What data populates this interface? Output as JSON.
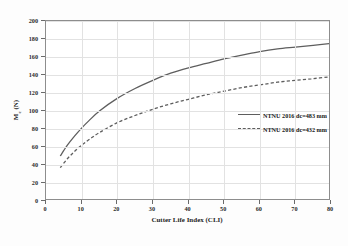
{
  "chart_data": {
    "type": "line",
    "title": "",
    "xlabel": "Cutter Life Index (CLI)",
    "ylabel": "Mₑ (N)",
    "ylabel_main": "M",
    "ylabel_sub": "c",
    "ylabel_unit": " (N)",
    "xlim": [
      0,
      80
    ],
    "ylim": [
      0,
      200
    ],
    "xticks": [
      0,
      10,
      20,
      30,
      40,
      50,
      60,
      70,
      80
    ],
    "yticks": [
      0,
      20,
      40,
      60,
      80,
      100,
      120,
      140,
      160,
      180,
      200
    ],
    "grid": true,
    "legend_position": "right-middle",
    "line_color": "#5e5e5e",
    "grid_color": "#e2e2e2",
    "frame_color": "#8d8d8d",
    "series": [
      {
        "name": "NTNU 2016 dc=483 mm",
        "style": "solid",
        "x": [
          4,
          6,
          8,
          10,
          12,
          15,
          20,
          25,
          30,
          35,
          40,
          45,
          50,
          55,
          60,
          65,
          70,
          75,
          80
        ],
        "values": [
          50,
          62,
          72,
          81,
          89,
          100,
          114,
          125,
          134,
          142,
          148,
          153,
          158,
          162,
          166,
          169,
          171,
          173,
          175
        ]
      },
      {
        "name": "NTNU 2016 dc=432 mm",
        "style": "dashed",
        "x": [
          4,
          6,
          8,
          10,
          12,
          15,
          20,
          25,
          30,
          35,
          40,
          45,
          50,
          55,
          60,
          65,
          70,
          75,
          80
        ],
        "values": [
          37,
          47,
          55,
          62,
          68,
          76,
          87,
          95,
          102,
          108,
          113,
          118,
          122,
          126,
          129,
          132,
          134,
          136,
          138
        ]
      }
    ]
  },
  "legend": {
    "entries": [
      {
        "label": "NTNU 2016 dc=483 mm",
        "style": "solid"
      },
      {
        "label": "NTNU 2016 dc=432 mm",
        "style": "dashed"
      }
    ]
  }
}
